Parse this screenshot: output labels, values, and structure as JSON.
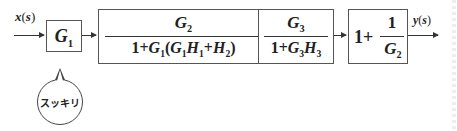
{
  "input_label": "x(s)",
  "output_label": "y(s)",
  "blocks": [
    {
      "id": "G1",
      "text": "G1"
    },
    {
      "id": "block2",
      "numerator": "G2",
      "denominator": "1+G1(G1H1+H2)"
    },
    {
      "id": "block3",
      "numerator": "G3",
      "denominator": "1+G3H3"
    },
    {
      "id": "block4",
      "prefix": "1+",
      "numerator": "1",
      "denominator": "G2"
    }
  ],
  "bubble": {
    "text": "スッキリ"
  }
}
